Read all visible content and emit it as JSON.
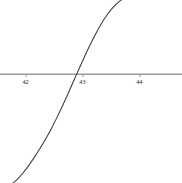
{
  "figure": {
    "width": 182,
    "height": 183,
    "background_color": "#ffffff",
    "curve_color": "#3a3a3a",
    "axis_color": "#9a9a9a",
    "label_color": "#1a1a1a"
  },
  "chart_data": {
    "type": "line",
    "title": "",
    "subtitle": "",
    "xlabel": "",
    "ylabel": "",
    "grid": false,
    "legend": null,
    "axis": {
      "x_zero_line": true,
      "y_axis_line": true,
      "x_axis_position_value": 0
    },
    "xlim": [
      41.55,
      44.75
    ],
    "ylim": [
      -0.0112,
      0.00755
    ],
    "xticks": [
      42,
      43,
      44
    ],
    "xtick_labels": [
      "42",
      "43",
      "44"
    ],
    "yticks": [
      0.006,
      0.004,
      0.002,
      0,
      -0.002,
      -0.004,
      -0.006,
      -0.008,
      -0.01
    ],
    "ytick_labels": [
      "0.006",
      "0.004",
      "0.002",
      "0",
      "-0.002",
      "-0.004",
      "-0.006",
      "-0.008",
      "-0.010"
    ],
    "series": [
      {
        "name": "curve",
        "x": [
          41.78,
          41.85,
          41.95,
          42.05,
          42.15,
          42.25,
          42.35,
          42.45,
          42.55,
          42.65,
          42.75,
          42.85,
          42.95,
          43.05,
          43.15,
          43.25,
          43.35,
          43.45,
          43.55,
          43.65,
          43.75,
          43.85,
          43.95,
          44.05,
          44.15,
          44.25,
          44.35,
          44.45,
          44.55,
          44.65,
          44.75
        ],
        "y": [
          -0.0112,
          -0.01085,
          -0.0102,
          -0.00944,
          -0.0086,
          -0.0077,
          -0.00672,
          -0.00566,
          -0.0045,
          -0.00328,
          -0.002,
          -0.00068,
          0.00064,
          0.00192,
          0.00314,
          0.00428,
          0.0053,
          0.00617,
          0.00687,
          0.00741,
          0.00781,
          0.00809,
          0.00827,
          0.00838,
          0.00844,
          0.00847,
          0.00848,
          0.00848,
          0.00847,
          0.00845,
          0.00843
        ]
      }
    ],
    "annotations": [],
    "zero_crossing_x": 42.9
  }
}
